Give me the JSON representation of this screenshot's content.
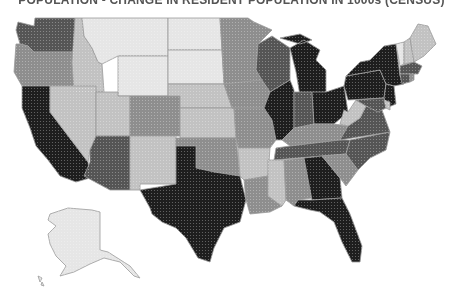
{
  "title": "POPULATION - CHANGE IN RESIDENT POPULATION IN 1000s (CENSUS)",
  "map": {
    "type": "choropleth",
    "region": "United States",
    "shade_scale": {
      "levels": 5,
      "colors": [
        "#e6e6e6",
        "#c2c2c2",
        "#8e8e8e",
        "#555555",
        "#1e1e1e"
      ],
      "description": "lightest (1) to darkest (5)"
    },
    "states": [
      {
        "code": "WA",
        "class": 4
      },
      {
        "code": "OR",
        "class": 3
      },
      {
        "code": "CA",
        "class": 5
      },
      {
        "code": "ID",
        "class": 2
      },
      {
        "code": "NV",
        "class": 2
      },
      {
        "code": "MT",
        "class": 1
      },
      {
        "code": "WY",
        "class": 1
      },
      {
        "code": "UT",
        "class": 2
      },
      {
        "code": "AZ",
        "class": 4
      },
      {
        "code": "CO",
        "class": 3
      },
      {
        "code": "NM",
        "class": 2
      },
      {
        "code": "ND",
        "class": 1
      },
      {
        "code": "SD",
        "class": 1
      },
      {
        "code": "NE",
        "class": 2
      },
      {
        "code": "KS",
        "class": 2
      },
      {
        "code": "OK",
        "class": 3
      },
      {
        "code": "TX",
        "class": 5
      },
      {
        "code": "MN",
        "class": 3
      },
      {
        "code": "IA",
        "class": 3
      },
      {
        "code": "MO",
        "class": 3
      },
      {
        "code": "AR",
        "class": 2
      },
      {
        "code": "LA",
        "class": 3
      },
      {
        "code": "WI",
        "class": 4
      },
      {
        "code": "IL",
        "class": 5
      },
      {
        "code": "MI",
        "class": 5
      },
      {
        "code": "IN",
        "class": 4
      },
      {
        "code": "OH",
        "class": 5
      },
      {
        "code": "KY",
        "class": 3
      },
      {
        "code": "TN",
        "class": 4
      },
      {
        "code": "MS",
        "class": 2
      },
      {
        "code": "AL",
        "class": 3
      },
      {
        "code": "GA",
        "class": 5
      },
      {
        "code": "FL",
        "class": 5
      },
      {
        "code": "SC",
        "class": 3
      },
      {
        "code": "NC",
        "class": 4
      },
      {
        "code": "VA",
        "class": 4
      },
      {
        "code": "WV",
        "class": 2
      },
      {
        "code": "PA",
        "class": 5
      },
      {
        "code": "NY",
        "class": 5
      },
      {
        "code": "NJ",
        "class": 5
      },
      {
        "code": "MD",
        "class": 4
      },
      {
        "code": "DE",
        "class": 2
      },
      {
        "code": "VT",
        "class": 1
      },
      {
        "code": "NH",
        "class": 2
      },
      {
        "code": "ME",
        "class": 2
      },
      {
        "code": "MA",
        "class": 4
      },
      {
        "code": "CT",
        "class": 4
      },
      {
        "code": "RI",
        "class": 3
      },
      {
        "code": "AK",
        "class": 1
      },
      {
        "code": "HI",
        "class": 1
      }
    ]
  }
}
